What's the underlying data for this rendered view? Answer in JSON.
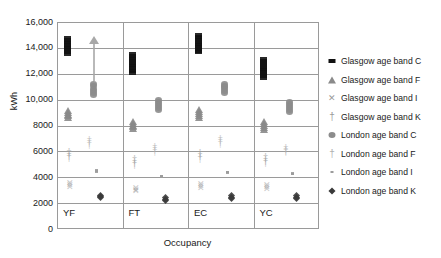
{
  "chart_data": {
    "type": "scatter",
    "title": "",
    "xlabel": "Occupancy",
    "ylabel": "kWh",
    "categories": [
      "YF",
      "FT",
      "EC",
      "YC"
    ],
    "ylim": [
      0,
      16000
    ],
    "yticks": [
      "0",
      "2000",
      "4000",
      "6000",
      "8000",
      "10,000",
      "12,000",
      "14,000",
      "16,000"
    ],
    "ytick_values": [
      0,
      2000,
      4000,
      6000,
      8000,
      10000,
      12000,
      14000,
      16000
    ],
    "grid": true,
    "legend_position": "right",
    "annotations": [
      {
        "type": "arrow-up",
        "category": "YF",
        "note": "upward arrow above London age band C column"
      }
    ],
    "series": [
      {
        "name": "Glasgow age band C",
        "marker": "filled-square",
        "color": "#111111",
        "values": [
          14000,
          12650,
          14200,
          12250
        ],
        "ranges": [
          [
            13400,
            14600
          ],
          [
            11900,
            13350
          ],
          [
            13500,
            14850
          ],
          [
            11550,
            12950
          ]
        ]
      },
      {
        "name": "Glasgow age band F",
        "marker": "triangle",
        "color": "#8a8a8a",
        "values": [
          8850,
          8000,
          8900,
          7950
        ],
        "ranges": [
          [
            8550,
            9150
          ],
          [
            7700,
            8300
          ],
          [
            8600,
            9200
          ],
          [
            7650,
            8250
          ]
        ]
      },
      {
        "name": "Glasgow age band I",
        "marker": "cross-x",
        "color": "#9a9a9a",
        "values": [
          3400,
          3050,
          3350,
          3250
        ],
        "ranges": [
          [
            3250,
            3550
          ],
          [
            2900,
            3200
          ],
          [
            3200,
            3500
          ],
          [
            3100,
            3400
          ]
        ]
      },
      {
        "name": "Glasgow age band K",
        "marker": "plus",
        "color": "#9a9a9a",
        "values": [
          5750,
          5200,
          5700,
          5350
        ],
        "ranges": [
          [
            5550,
            5950
          ],
          [
            5000,
            5400
          ],
          [
            5500,
            5900
          ],
          [
            5150,
            5550
          ]
        ]
      },
      {
        "name": "London age band C",
        "marker": "filled-circle",
        "color": "#8c8c8c",
        "values": [
          10700,
          9500,
          10800,
          9400
        ],
        "ranges": [
          [
            10300,
            11100
          ],
          [
            9150,
            9900
          ],
          [
            10450,
            11150
          ],
          [
            9000,
            9750
          ]
        ]
      },
      {
        "name": "London age band F",
        "marker": "plus-light",
        "color": "#b0b0b0",
        "values": [
          6750,
          6150,
          6800,
          6100
        ],
        "ranges": [
          [
            6600,
            6900
          ],
          [
            6000,
            6300
          ],
          [
            6650,
            6950
          ],
          [
            6000,
            6250
          ]
        ]
      },
      {
        "name": "London age band I",
        "marker": "small-dash",
        "color": "#9c9c9c",
        "values": [
          4250,
          3850,
          4150,
          4050
        ],
        "ranges": [
          [
            4200,
            4300
          ],
          [
            3800,
            3900
          ],
          [
            4100,
            4200
          ],
          [
            4000,
            4100
          ]
        ]
      },
      {
        "name": "London age band K",
        "marker": "filled-diamond",
        "color": "#3a3a3a",
        "values": [
          2400,
          2200,
          2350,
          2350
        ],
        "ranges": [
          [
            2300,
            2500
          ],
          [
            2100,
            2300
          ],
          [
            2250,
            2450
          ],
          [
            2250,
            2450
          ]
        ]
      }
    ]
  },
  "legend": {
    "items": [
      {
        "label": "Glasgow age band C",
        "marker": "filled-square"
      },
      {
        "label": "Glasgow age band F",
        "marker": "triangle"
      },
      {
        "label": "Glasgow age band I",
        "marker": "cross-x"
      },
      {
        "label": "Glasgow age band K",
        "marker": "plus"
      },
      {
        "label": "London age band C",
        "marker": "filled-circle"
      },
      {
        "label": "London age band F",
        "marker": "plus-light"
      },
      {
        "label": "London age band I",
        "marker": "small-dash"
      },
      {
        "label": "London age band K",
        "marker": "filled-diamond"
      }
    ]
  }
}
